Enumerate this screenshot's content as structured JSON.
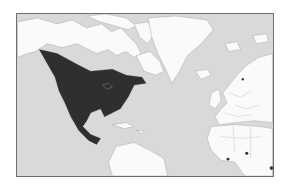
{
  "map": {
    "title": "Species range map",
    "projection": "world-mercator-north-atlantic",
    "colors": {
      "ocean": "#d9d9d9",
      "land": "#fafafa",
      "range": "#2f2f2f",
      "frame": "#6e6e6e",
      "border": "#b0b0b0"
    },
    "regions_shown": [
      "North America",
      "Greenland",
      "Europe",
      "North Africa",
      "South America (north)",
      "Central America",
      "Caribbean"
    ],
    "highlighted_range": {
      "label": "Distribution range",
      "covers": [
        "Canada (southern/central)",
        "United States",
        "Mexico",
        "Central America (north)"
      ]
    },
    "other_marks": [
      "small dark spots in Africa"
    ]
  }
}
